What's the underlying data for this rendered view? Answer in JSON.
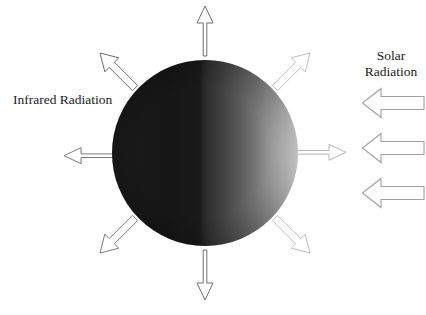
{
  "figure": {
    "width": 426,
    "height": 315,
    "background": "#ffffff",
    "type": "schematic-diagram"
  },
  "labels": {
    "infrared": "Infrared Radiation",
    "solar_line1": "Solar",
    "solar_line2": "Radiation"
  },
  "planet": {
    "name": "planet-sphere",
    "center_x": 205,
    "center_y": 153,
    "radius": 93,
    "shading": "terminator-gradient",
    "dark_side": "left",
    "lit_side": "right",
    "dark_color": "#161616",
    "mid_color": "#3a3a3a",
    "light_color": "#cfcfcf",
    "limb_color": "#f2f2f2"
  },
  "outgoing_arrows": {
    "count": 8,
    "style": "thin outlined open arrow",
    "fill": "#ffffff",
    "dark_stroke": "#5a5a5a",
    "light_stroke": "#c2c2c2",
    "directions": [
      {
        "name": "north",
        "angle_deg": 90,
        "shade": "dark"
      },
      {
        "name": "northeast",
        "angle_deg": 45,
        "shade": "light"
      },
      {
        "name": "east",
        "angle_deg": 0,
        "shade": "light"
      },
      {
        "name": "southeast",
        "angle_deg": -45,
        "shade": "light"
      },
      {
        "name": "south",
        "angle_deg": -90,
        "shade": "dark"
      },
      {
        "name": "southwest",
        "angle_deg": -135,
        "shade": "dark"
      },
      {
        "name": "west",
        "angle_deg": 180,
        "shade": "dark"
      },
      {
        "name": "northwest",
        "angle_deg": 135,
        "shade": "dark"
      }
    ]
  },
  "solar_arrows": {
    "count": 3,
    "direction": "left",
    "fill": "#ffffff",
    "stroke": "#9a9a9a",
    "positions_y": [
      88,
      133,
      178
    ],
    "left_x": 362,
    "right_x": 424,
    "height": 30
  }
}
